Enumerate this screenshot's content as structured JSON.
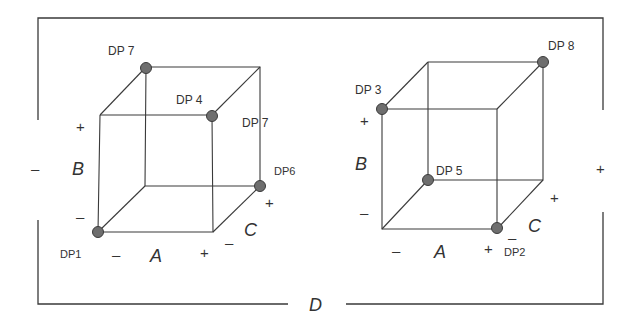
{
  "diagram": {
    "factor_d": {
      "label": "D",
      "minus": "–",
      "plus": "+"
    },
    "cubes": [
      {
        "id": "left",
        "axes": {
          "a": "A",
          "b": "B",
          "c": "C"
        },
        "signs": {
          "a_minus": "–",
          "a_plus": "+",
          "b_minus": "–",
          "b_plus": "+",
          "c_minus": "–",
          "c_plus": "+"
        },
        "points": [
          {
            "label": "DP1",
            "corner": "A-,B-,C-"
          },
          {
            "label": "DP 4",
            "corner": "A+,B+,C-"
          },
          {
            "label": "DP 7",
            "corner": "A-,B+,C+"
          },
          {
            "label": "DP6",
            "corner": "A+,B-,C+"
          }
        ],
        "extra_labels": [
          {
            "label": "DP 7"
          }
        ]
      },
      {
        "id": "right",
        "axes": {
          "a": "A",
          "b": "B",
          "c": "C"
        },
        "signs": {
          "a_minus": "–",
          "a_plus": "+",
          "b_minus": "–",
          "b_plus": "+",
          "c_minus": "–",
          "c_plus": "+"
        },
        "points": [
          {
            "label": "DP 3",
            "corner": "A-,B+,C-"
          },
          {
            "label": "DP 8",
            "corner": "A+,B+,C+"
          },
          {
            "label": "DP 5",
            "corner": "A-,B-,C+"
          },
          {
            "label": "DP2",
            "corner": "A+,B-,C-"
          }
        ]
      }
    ]
  }
}
